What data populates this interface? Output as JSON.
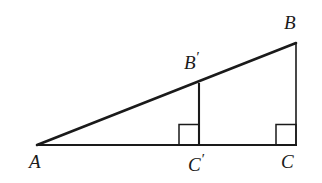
{
  "figure": {
    "background_color": "#ffffff",
    "stroke_color": "#1a1a1a",
    "width": 322,
    "height": 183,
    "labels": {
      "a": "A",
      "b": "B",
      "b_prime_base": "B",
      "b_prime_mark": "′",
      "c": "C",
      "c_prime_base": "C",
      "c_prime_mark": "′"
    },
    "points": {
      "A": {
        "x": 37,
        "y": 145
      },
      "B": {
        "x": 296,
        "y": 43
      },
      "C": {
        "x": 296,
        "y": 145
      },
      "B_prime": {
        "x": 199,
        "y": 83
      },
      "C_prime": {
        "x": 199,
        "y": 145
      }
    },
    "segments": [
      {
        "name": "hypotenuse-AB",
        "from": "A",
        "to": "B",
        "width": 2.6
      },
      {
        "name": "base-AC",
        "from": "A",
        "to": "C",
        "width": 2.0
      },
      {
        "name": "leg-BC",
        "from": "B",
        "to": "C",
        "width": 1.6
      },
      {
        "name": "altitude-BpCp",
        "from": "B_prime",
        "to": "C_prime",
        "width": 2.1
      }
    ],
    "right_angle_marks": [
      {
        "name": "right-angle-at-C-prime",
        "x": 179,
        "y": 124,
        "size": 20
      },
      {
        "name": "right-angle-at-C",
        "x": 276,
        "y": 124,
        "size": 20
      }
    ]
  }
}
